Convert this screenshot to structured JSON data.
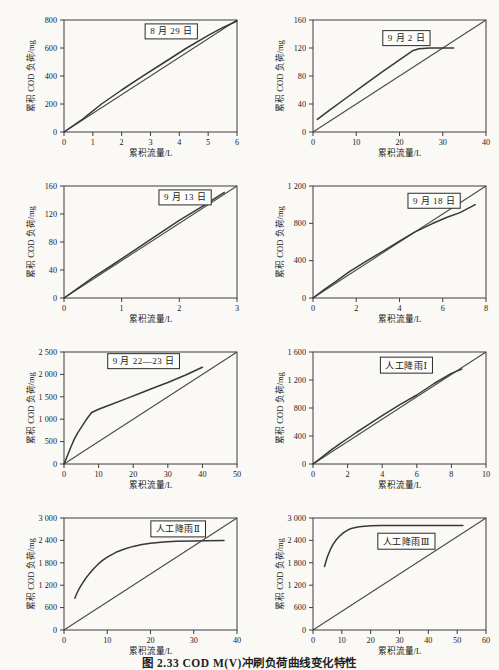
{
  "figure": {
    "caption": "图 2.33  COD M(V)冲刷负荷曲线变化特性",
    "colors": {
      "frame": "#3d3d3d",
      "reference": "#4a4a4a",
      "curve": "#383838",
      "text": "#1a1a1a",
      "box_border": "#2a2a2a",
      "box_fill": "#fdfdfb",
      "background": "#faf9f6"
    }
  },
  "chart_data": [
    {
      "type": "line",
      "title": "8 月 29 日",
      "xlabel": "累积流量/L",
      "ylabel": "累积 COD 负荷/mg",
      "xlim": [
        0,
        6
      ],
      "ylim": [
        0,
        800
      ],
      "xticks": [
        0,
        1,
        2,
        3,
        4,
        5,
        6
      ],
      "xtick_labels": [
        "0",
        "1",
        "2",
        "3",
        "4",
        "5",
        "6"
      ],
      "yticks": [
        0,
        200,
        400,
        600,
        800
      ],
      "ytick_labels": [
        "0",
        "200",
        "400",
        "600",
        "800"
      ],
      "annotation": {
        "text": "8 月 29 日",
        "x_frac": 0.62,
        "y_frac": 0.1
      },
      "series": [
        {
          "name": "对角线",
          "points": [
            [
              0,
              0
            ],
            [
              6,
              800
            ]
          ]
        },
        {
          "name": "累积COD负荷",
          "points": [
            [
              0,
              0
            ],
            [
              0.65,
              92
            ],
            [
              1.3,
              200
            ],
            [
              2,
              300
            ],
            [
              2.7,
              395
            ],
            [
              3.5,
              500
            ],
            [
              4.2,
              593
            ],
            [
              5,
              690
            ],
            [
              5.5,
              745
            ],
            [
              6,
              793
            ]
          ]
        }
      ]
    },
    {
      "type": "line",
      "title": "9 月 2 日",
      "xlabel": "累积流量/L",
      "ylabel": "累积 COD 负荷/mg",
      "xlim": [
        0,
        40
      ],
      "ylim": [
        0,
        160
      ],
      "xticks": [
        0,
        10,
        20,
        30,
        40
      ],
      "xtick_labels": [
        "0",
        "10",
        "20",
        "30",
        "40"
      ],
      "yticks": [
        0,
        40,
        80,
        120,
        160
      ],
      "ytick_labels": [
        "0",
        "40",
        "80",
        "120",
        "160"
      ],
      "annotation": {
        "text": "9 月 2 日",
        "x_frac": 0.54,
        "y_frac": 0.16
      },
      "series": [
        {
          "name": "对角线",
          "points": [
            [
              0,
              0
            ],
            [
              40,
              160
            ]
          ]
        },
        {
          "name": "累积COD负荷",
          "points": [
            [
              1,
              18
            ],
            [
              4,
              32
            ],
            [
              8,
              50
            ],
            [
              12,
              68
            ],
            [
              16,
              86
            ],
            [
              20,
              103
            ],
            [
              23,
              116
            ],
            [
              24.5,
              119
            ],
            [
              27,
              120
            ],
            [
              30,
              120
            ],
            [
              32.5,
              120
            ]
          ]
        }
      ]
    },
    {
      "type": "line",
      "title": "9 月 13 日",
      "xlabel": "累积流量/L",
      "ylabel": "累积 COD 负荷/mg",
      "xlim": [
        0,
        3
      ],
      "ylim": [
        0,
        160
      ],
      "xticks": [
        0,
        1,
        2,
        3
      ],
      "xtick_labels": [
        "0",
        "1",
        "2",
        "3"
      ],
      "yticks": [
        0,
        40,
        80,
        120,
        160
      ],
      "ytick_labels": [
        "0",
        "40",
        "80",
        "120",
        "160"
      ],
      "annotation": {
        "text": "9 月 13 日",
        "x_frac": 0.7,
        "y_frac": 0.1
      },
      "series": [
        {
          "name": "对角线",
          "points": [
            [
              0,
              0
            ],
            [
              3,
              160
            ]
          ]
        },
        {
          "name": "累积COD负荷",
          "points": [
            [
              0,
              0
            ],
            [
              0.5,
              29
            ],
            [
              0.8,
              45
            ],
            [
              1.2,
              67
            ],
            [
              1.6,
              89
            ],
            [
              2,
              111
            ],
            [
              2.4,
              131
            ],
            [
              2.78,
              151
            ]
          ]
        }
      ]
    },
    {
      "type": "line",
      "title": "9 月 18 日",
      "xlabel": "累积流量/L",
      "ylabel": "累积 COD 负荷/mg",
      "xlim": [
        0,
        8
      ],
      "ylim": [
        0,
        1200
      ],
      "xticks": [
        0,
        2,
        4,
        6,
        8
      ],
      "xtick_labels": [
        "0",
        "2",
        "4",
        "6",
        "8"
      ],
      "yticks": [
        0,
        400,
        800,
        1200
      ],
      "ytick_labels": [
        "0",
        "400",
        "800",
        "1 200"
      ],
      "annotation": {
        "text": "9 月 18 日",
        "x_frac": 0.7,
        "y_frac": 0.13
      },
      "series": [
        {
          "name": "对角线",
          "points": [
            [
              0,
              0
            ],
            [
              8,
              1200
            ]
          ]
        },
        {
          "name": "累积COD负荷",
          "points": [
            [
              0,
              0
            ],
            [
              0.5,
              88
            ],
            [
              1,
              168
            ],
            [
              1.7,
              285
            ],
            [
              2.5,
              400
            ],
            [
              3.3,
              510
            ],
            [
              4,
              610
            ],
            [
              4.7,
              705
            ],
            [
              5.5,
              795
            ],
            [
              6.2,
              865
            ],
            [
              6.8,
              915
            ],
            [
              7.5,
              1000
            ]
          ]
        }
      ]
    },
    {
      "type": "line",
      "title": "9 月 22—23 日",
      "xlabel": "累积流量/L",
      "ylabel": "累积 COD 负荷/mg",
      "xlim": [
        0,
        50
      ],
      "ylim": [
        0,
        2500
      ],
      "xticks": [
        0,
        10,
        20,
        30,
        40,
        50
      ],
      "xtick_labels": [
        "0",
        "10",
        "20",
        "30",
        "40",
        "50"
      ],
      "yticks": [
        0,
        500,
        1000,
        1500,
        2000,
        2500
      ],
      "ytick_labels": [
        "0",
        "500",
        "1 000",
        "1 500",
        "2 000",
        "2 500"
      ],
      "annotation": {
        "text": "9 月 22—23 日",
        "x_frac": 0.46,
        "y_frac": 0.08
      },
      "series": [
        {
          "name": "对角线",
          "points": [
            [
              0,
              0
            ],
            [
              50,
              2500
            ]
          ]
        },
        {
          "name": "累积COD负荷",
          "points": [
            [
              0,
              0
            ],
            [
              1,
              190
            ],
            [
              2,
              380
            ],
            [
              3,
              560
            ],
            [
              4,
              700
            ],
            [
              5,
              820
            ],
            [
              6,
              940
            ],
            [
              7,
              1050
            ],
            [
              8,
              1150
            ],
            [
              10,
              1220
            ],
            [
              14,
              1340
            ],
            [
              18,
              1460
            ],
            [
              22,
              1580
            ],
            [
              26,
              1700
            ],
            [
              30,
              1820
            ],
            [
              35,
              1980
            ],
            [
              40,
              2160
            ]
          ]
        }
      ]
    },
    {
      "type": "line",
      "title": "人工降雨Ⅰ",
      "xlabel": "累积流量/L",
      "ylabel": "累积 COD 负荷/mg",
      "xlim": [
        0,
        10
      ],
      "ylim": [
        0,
        1600
      ],
      "xticks": [
        0,
        2,
        4,
        6,
        8,
        10
      ],
      "xtick_labels": [
        "0",
        "2",
        "4",
        "6",
        "8",
        "10"
      ],
      "yticks": [
        0,
        400,
        800,
        1200,
        1600
      ],
      "ytick_labels": [
        "0",
        "400",
        "800",
        "1 200",
        "1 600"
      ],
      "annotation": {
        "text": "人工降雨Ⅰ",
        "x_frac": 0.54,
        "y_frac": 0.12
      },
      "series": [
        {
          "name": "对角线",
          "points": [
            [
              0,
              0
            ],
            [
              10,
              1600
            ]
          ]
        },
        {
          "name": "累积COD负荷",
          "points": [
            [
              0,
              0
            ],
            [
              0.5,
              95
            ],
            [
              1,
              190
            ],
            [
              1.5,
              280
            ],
            [
              2,
              365
            ],
            [
              2.5,
              450
            ],
            [
              3,
              530
            ],
            [
              4,
              690
            ],
            [
              5,
              845
            ],
            [
              6,
              985
            ],
            [
              7,
              1150
            ],
            [
              8,
              1295
            ],
            [
              8.6,
              1355
            ]
          ]
        }
      ]
    },
    {
      "type": "line",
      "title": "人工降雨Ⅱ",
      "xlabel": "累积流量/L",
      "ylabel": "累积 COD 负荷/mg",
      "xlim": [
        0,
        40
      ],
      "ylim": [
        0,
        3000
      ],
      "xticks": [
        0,
        10,
        20,
        30,
        40
      ],
      "xtick_labels": [
        "0",
        "10",
        "20",
        "30",
        "40"
      ],
      "yticks": [
        0,
        600,
        1200,
        1800,
        2400,
        3000
      ],
      "ytick_labels": [
        "0",
        "600",
        "1 200",
        "1 800",
        "2 400",
        "3 000"
      ],
      "annotation": {
        "text": "人工降雨Ⅱ",
        "x_frac": 0.66,
        "y_frac": 0.1
      },
      "series": [
        {
          "name": "对角线",
          "points": [
            [
              0,
              0
            ],
            [
              40,
              3000
            ]
          ]
        },
        {
          "name": "累积COD负荷",
          "points": [
            [
              2.5,
              850
            ],
            [
              3,
              990
            ],
            [
              3.5,
              1100
            ],
            [
              4,
              1200
            ],
            [
              5,
              1380
            ],
            [
              6,
              1530
            ],
            [
              7,
              1660
            ],
            [
              8,
              1775
            ],
            [
              9,
              1870
            ],
            [
              10,
              1950
            ],
            [
              12,
              2080
            ],
            [
              14,
              2170
            ],
            [
              16,
              2240
            ],
            [
              18,
              2290
            ],
            [
              20,
              2325
            ],
            [
              23,
              2355
            ],
            [
              26,
              2375
            ],
            [
              30,
              2385
            ],
            [
              33,
              2390
            ],
            [
              37,
              2395
            ]
          ]
        }
      ]
    },
    {
      "type": "line",
      "title": "人工降雨Ⅲ",
      "xlabel": "累积流量/L",
      "ylabel": "累积 COD 负荷/mg",
      "xlim": [
        0,
        60
      ],
      "ylim": [
        0,
        3000
      ],
      "xticks": [
        0,
        10,
        20,
        30,
        40,
        50,
        60
      ],
      "xtick_labels": [
        "0",
        "10",
        "20",
        "30",
        "40",
        "50",
        "60"
      ],
      "yticks": [
        0,
        600,
        1200,
        1800,
        2400,
        3000
      ],
      "ytick_labels": [
        "0",
        "600",
        "1 200",
        "1 800",
        "2 400",
        "3 000"
      ],
      "annotation": {
        "text": "人工降雨Ⅲ",
        "x_frac": 0.54,
        "y_frac": 0.21
      },
      "series": [
        {
          "name": "对角线",
          "points": [
            [
              0,
              0
            ],
            [
              60,
              3000
            ]
          ]
        },
        {
          "name": "累积COD负荷",
          "points": [
            [
              4,
              1700
            ],
            [
              4.5,
              1840
            ],
            [
              5,
              1960
            ],
            [
              5.5,
              2060
            ],
            [
              6,
              2150
            ],
            [
              7,
              2300
            ],
            [
              8,
              2410
            ],
            [
              9,
              2500
            ],
            [
              10,
              2570
            ],
            [
              11,
              2630
            ],
            [
              12,
              2675
            ],
            [
              13,
              2710
            ],
            [
              14,
              2735
            ],
            [
              16,
              2765
            ],
            [
              18,
              2780
            ],
            [
              20,
              2790
            ],
            [
              24,
              2798
            ],
            [
              28,
              2800
            ],
            [
              34,
              2800
            ],
            [
              40,
              2800
            ],
            [
              46,
              2800
            ],
            [
              52,
              2800
            ]
          ]
        }
      ]
    }
  ]
}
